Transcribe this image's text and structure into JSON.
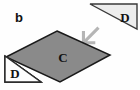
{
  "figure": {
    "panel_label": "b",
    "background_color": "#fefefe",
    "shapes": {
      "parallelogram": {
        "label": "C",
        "fill_color": "#8a8a8a",
        "stroke_color": "#1a1a1a",
        "label_x": 63,
        "label_y": 61
      },
      "triangle_lower_left": {
        "label": "D",
        "fill_color": "#fdfdfd",
        "stroke_color": "#2b2b2b",
        "label_x": 15,
        "label_y": 77
      },
      "triangle_upper_right": {
        "label": "D",
        "fill_color": "#ededed",
        "stroke_color": "#3a3a3a",
        "label_x": 125,
        "label_y": 22
      },
      "arrow": {
        "name": "down-left-arrow",
        "fill_color": "#b5b5b5",
        "direction": "down-left"
      }
    }
  }
}
